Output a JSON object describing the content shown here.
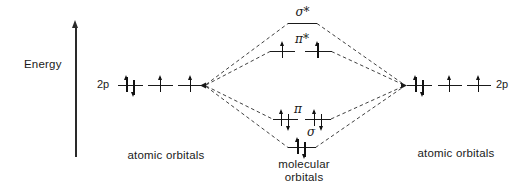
{
  "energy_axis": {
    "label": "Energy"
  },
  "left_atomic": {
    "shell_label": "2p",
    "caption": "atomic orbitals",
    "orbitals": [
      [
        "up",
        "down"
      ],
      [
        "up"
      ],
      [
        "up"
      ]
    ]
  },
  "right_atomic": {
    "shell_label": "2p",
    "caption": "atomic orbitals",
    "orbitals": [
      [
        "up",
        "down"
      ],
      [
        "up"
      ],
      [
        "up"
      ]
    ]
  },
  "molecular": {
    "caption_line1": "molecular",
    "caption_line2": "orbitals",
    "levels": {
      "sigma_star": {
        "label": "σ*",
        "electrons": []
      },
      "pi_star": {
        "label": "π*",
        "left": [
          "up"
        ],
        "right": [
          "up"
        ]
      },
      "pi": {
        "label": "π",
        "left": [
          "up",
          "down"
        ],
        "right": [
          "up",
          "down"
        ]
      },
      "sigma": {
        "label": "σ",
        "electrons": [
          "up",
          "down"
        ]
      }
    }
  },
  "colors": {
    "ink": "#1a1a1a",
    "background": "#ffffff"
  }
}
